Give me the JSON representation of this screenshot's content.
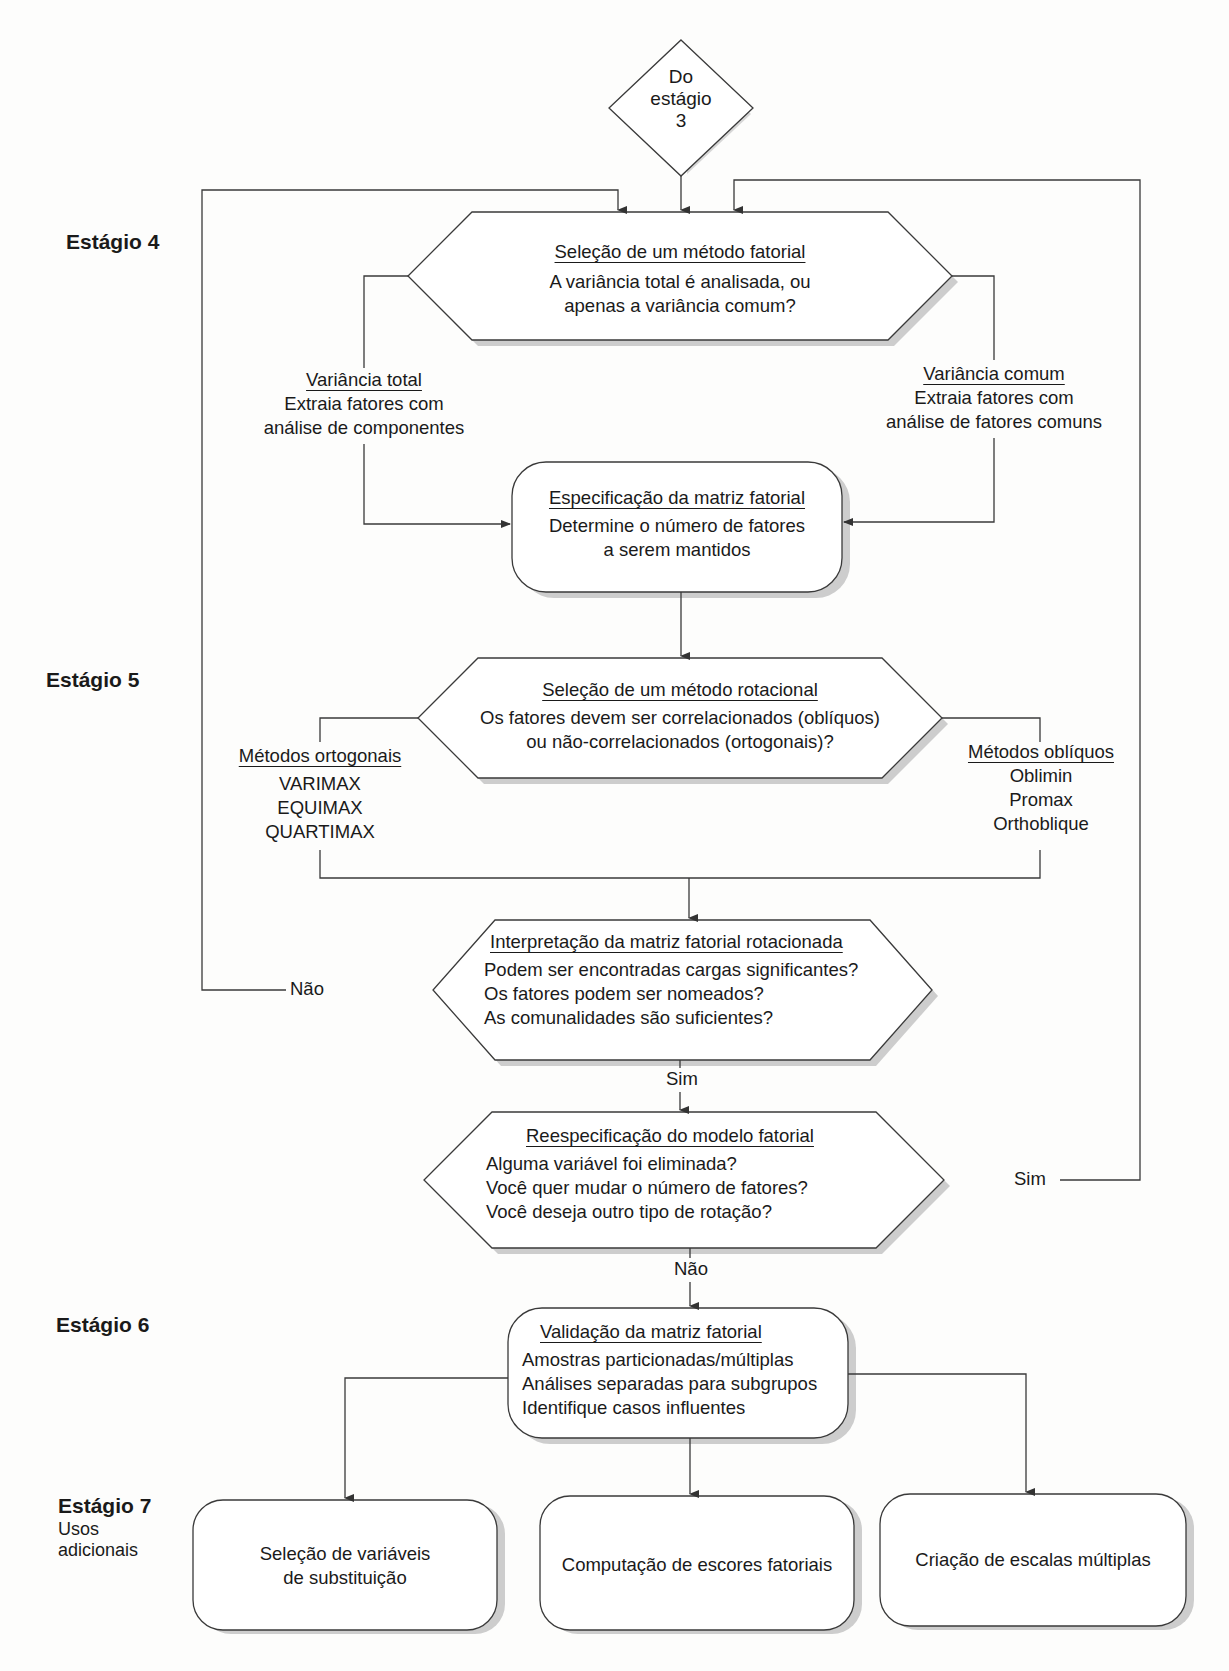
{
  "stages": {
    "s4": "Estágio 4",
    "s5": "Estágio 5",
    "s6": "Estágio 6",
    "s7": "Estágio 7",
    "s7_sub": [
      "Usos",
      "adicionais"
    ]
  },
  "start": {
    "lines": [
      "Do",
      "estágio",
      "3"
    ]
  },
  "method_select": {
    "title": "Seleção de um método fatorial",
    "lines": [
      "A variância total é analisada, ou",
      "apenas a variância comum?"
    ]
  },
  "total_variance": {
    "title": "Variância total",
    "lines": [
      "Extraia fatores com",
      "análise de componentes"
    ]
  },
  "common_variance": {
    "title": "Variância comum",
    "lines": [
      "Extraia fatores com",
      "análise de fatores comuns"
    ]
  },
  "matrix_spec": {
    "title": "Especificação da matriz fatorial",
    "lines": [
      "Determine o número de fatores",
      "a serem mantidos"
    ]
  },
  "rotation_select": {
    "title": "Seleção de um método rotacional",
    "lines": [
      "Os fatores devem ser correlacionados (oblíquos)",
      "ou não-correlacionados (ortogonais)?"
    ]
  },
  "orthogonal": {
    "title": "Métodos ortogonais",
    "items": [
      "VARIMAX",
      "EQUIMAX",
      "QUARTIMAX"
    ]
  },
  "oblique": {
    "title": "Métodos oblíquos",
    "items": [
      "Oblimin",
      "Promax",
      "Orthoblique"
    ]
  },
  "interpretation": {
    "title": "Interpretação da matriz fatorial rotacionada",
    "lines": [
      "Podem ser encontradas cargas significantes?",
      "Os fatores podem ser nomeados?",
      "As comunalidades são suficientes?"
    ]
  },
  "respec": {
    "title": "Reespecificação do modelo fatorial",
    "lines": [
      "Alguma variável foi eliminada?",
      "Você quer mudar o número de fatores?",
      "Você deseja outro tipo de rotação?"
    ]
  },
  "validation": {
    "title": "Validação da matriz fatorial",
    "lines": [
      "Amostras particionadas/múltiplas",
      "Análises separadas para subgrupos",
      "Identifique casos influentes"
    ]
  },
  "uses": {
    "surrogate": [
      "Seleção de variáveis",
      "de substituição"
    ],
    "scores": "Computação de escores fatoriais",
    "scales": "Criação de escalas múltiplas"
  },
  "edge_labels": {
    "interp_no": "Não",
    "interp_yes": "Sim",
    "respec_yes": "Sim",
    "respec_no": "Não"
  },
  "colors": {
    "line": "#3a3a3a",
    "shadow": "#c8c8c8",
    "background": "#fdfdfc"
  }
}
